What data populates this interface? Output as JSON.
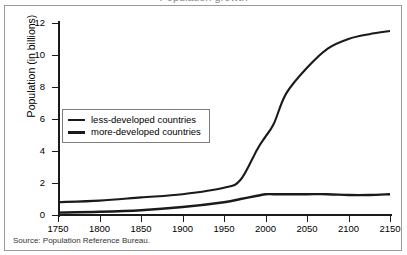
{
  "figure": {
    "title_partial": "Population growth",
    "source": "Source: Population Reference Bureau."
  },
  "axes": {
    "ylabel": "Population (in billions)",
    "yticks": [
      "0",
      "2",
      "4",
      "6",
      "8",
      "10",
      "12"
    ],
    "xticks": [
      "1750",
      "1800",
      "1850",
      "1900",
      "1950",
      "2000",
      "2050",
      "2100",
      "2150"
    ]
  },
  "legend": {
    "items": [
      {
        "label": "less-developed countries"
      },
      {
        "label": "more-developed countries"
      }
    ]
  },
  "colors": {
    "line": "#1a1a1a",
    "frame": "#9a9a9a",
    "background": "#ffffff"
  },
  "chart_data": {
    "type": "line",
    "title": "Population growth",
    "xlabel": "",
    "ylabel": "Population (in billions)",
    "xlim": [
      1750,
      2150
    ],
    "ylim": [
      0,
      12
    ],
    "grid": false,
    "legend_position": "inside-left",
    "x": [
      1750,
      1800,
      1850,
      1900,
      1950,
      1970,
      1990,
      2000,
      2010,
      2025,
      2050,
      2075,
      2100,
      2125,
      2150
    ],
    "series": [
      {
        "name": "less-developed countries",
        "values": [
          0.8,
          0.9,
          1.1,
          1.3,
          1.7,
          2.2,
          4.1,
          4.9,
          5.7,
          7.6,
          9.2,
          10.4,
          11.0,
          11.3,
          11.5
        ]
      },
      {
        "name": "more-developed countries",
        "values": [
          0.15,
          0.2,
          0.3,
          0.5,
          0.8,
          1.0,
          1.2,
          1.3,
          1.3,
          1.3,
          1.3,
          1.3,
          1.25,
          1.25,
          1.3
        ]
      }
    ]
  }
}
